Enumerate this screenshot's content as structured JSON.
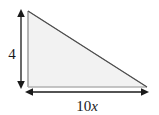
{
  "figure": {
    "kind": "right-triangle-diagram",
    "background_color": "#ffffff",
    "shape": {
      "name": "right triangle",
      "fill_color": "#f2f2f2",
      "stroke_color": "#8c8c8c",
      "hypotenuse_stroke_color": "#555555",
      "vertices": [
        {
          "label": "top-left",
          "x": 28,
          "y": 11
        },
        {
          "label": "bottom-left",
          "x": 28,
          "y": 87
        },
        {
          "label": "bottom-right",
          "x": 147,
          "y": 87
        }
      ]
    },
    "dimensions": [
      {
        "id": "height",
        "label_text": "4",
        "label_variable": "",
        "orientation": "vertical",
        "arrow_color": "#1a1a1a",
        "from": {
          "x": 21,
          "y": 11
        },
        "to": {
          "x": 21,
          "y": 87
        },
        "label_position": {
          "x": 12,
          "y": 54
        }
      },
      {
        "id": "base",
        "label_text": "10",
        "label_variable": "x",
        "orientation": "horizontal",
        "arrow_color": "#1a1a1a",
        "from": {
          "x": 27,
          "y": 92
        },
        "to": {
          "x": 147,
          "y": 92
        },
        "label_position": {
          "x": 87,
          "y": 110
        }
      }
    ]
  }
}
